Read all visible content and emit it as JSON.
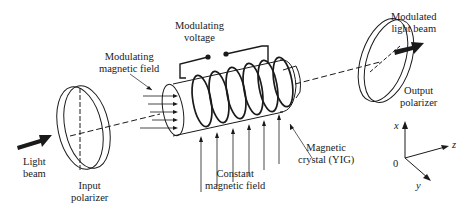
{
  "diagram": {
    "labels": {
      "modulating_voltage": [
        "Modulating",
        "voltage"
      ],
      "modulating_magnetic_field": [
        "Modulating",
        "magnetic field"
      ],
      "modulated_light_beam": [
        "Modulated",
        "light beam"
      ],
      "output_polarizer": [
        "Output",
        "polarizer"
      ],
      "light_beam": [
        "Light",
        "beam"
      ],
      "input_polarizer": [
        "Input",
        "polarizer"
      ],
      "constant_magnetic_field": [
        "Constant",
        "magnetic field"
      ],
      "magnetic_crystal": [
        "Magnetic",
        "crystal (YIG)"
      ]
    },
    "axes": {
      "x": "x",
      "y": "y",
      "z": "z",
      "origin": "0"
    },
    "colors": {
      "line": "#1a1a1a",
      "background": "#ffffff"
    }
  }
}
